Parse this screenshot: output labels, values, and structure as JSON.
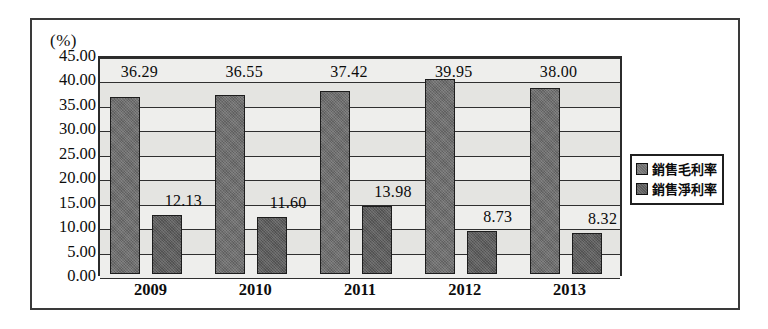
{
  "chart_data": {
    "type": "bar",
    "title": "",
    "subtitle": "",
    "xlabel": "",
    "ylabel": "(%)",
    "unit_label": "(%)",
    "categories": [
      "2009",
      "2010",
      "2011",
      "2012",
      "2013"
    ],
    "series": [
      {
        "name": "銷售毛利率",
        "values": [
          36.29,
          36.55,
          37.42,
          39.95,
          38.0
        ],
        "labels": [
          "36.29",
          "36.55",
          "37.42",
          "39.95",
          "38.00"
        ],
        "color": "#6e6e6e"
      },
      {
        "name": "銷售淨利率",
        "values": [
          12.13,
          11.6,
          13.98,
          8.73,
          8.32
        ],
        "labels": [
          "12.13",
          "11.60",
          "13.98",
          "8.73",
          "8.32"
        ],
        "color": "#5d5d5d"
      }
    ],
    "ylim": [
      0,
      45
    ],
    "ytick_step": 5,
    "ytick_labels": [
      "45.00",
      "40.00",
      "35.00",
      "30.00",
      "25.00",
      "20.00",
      "15.00",
      "10.00",
      "5.00",
      "0.00"
    ],
    "ytick_values": [
      45,
      40,
      35,
      30,
      25,
      20,
      15,
      10,
      5,
      0
    ],
    "grid": true,
    "grid_axis": "y",
    "legend_position": "right",
    "legend_entries": [
      "銷售毛利率",
      "銷售淨利率"
    ],
    "plot_background": "#e9e9e7",
    "frame_color": "#2b2b2b"
  }
}
